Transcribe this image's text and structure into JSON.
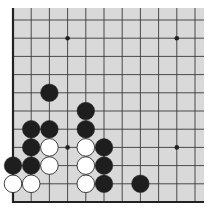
{
  "board": {
    "size": 19,
    "visible_region": "lower-left corner",
    "visible_columns": 11,
    "visible_rows": 11,
    "background_color": "#d9d9d9",
    "line_color": "#3a3a3a",
    "edge_color": "#222222",
    "black_stone_color": "#1e1e1e",
    "white_stone_color": "#ffffff",
    "star_points": [
      {
        "col": 3,
        "row": 3
      },
      {
        "col": 9,
        "row": 3
      },
      {
        "col": 3,
        "row": 9
      },
      {
        "col": 9,
        "row": 9
      }
    ],
    "stones": [
      {
        "color": "white",
        "col": 0,
        "row": 1
      },
      {
        "color": "white",
        "col": 1,
        "row": 1
      },
      {
        "color": "white",
        "col": 4,
        "row": 1
      },
      {
        "color": "black",
        "col": 5,
        "row": 1
      },
      {
        "color": "black",
        "col": 7,
        "row": 1
      },
      {
        "color": "black",
        "col": 0,
        "row": 2
      },
      {
        "color": "black",
        "col": 1,
        "row": 2
      },
      {
        "color": "white",
        "col": 2,
        "row": 2
      },
      {
        "color": "white",
        "col": 4,
        "row": 2
      },
      {
        "color": "black",
        "col": 5,
        "row": 2
      },
      {
        "color": "black",
        "col": 1,
        "row": 3
      },
      {
        "color": "white",
        "col": 2,
        "row": 3
      },
      {
        "color": "white",
        "col": 4,
        "row": 3
      },
      {
        "color": "black",
        "col": 5,
        "row": 3
      },
      {
        "color": "black",
        "col": 1,
        "row": 4
      },
      {
        "color": "black",
        "col": 2,
        "row": 4
      },
      {
        "color": "black",
        "col": 4,
        "row": 4
      },
      {
        "color": "black",
        "col": 4,
        "row": 5
      },
      {
        "color": "black",
        "col": 2,
        "row": 6
      }
    ]
  }
}
